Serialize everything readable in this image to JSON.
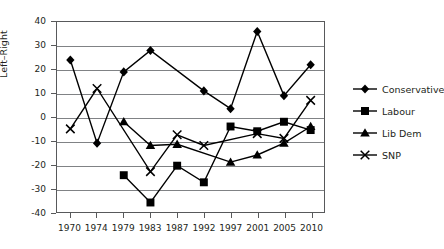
{
  "chart_data": {
    "type": "line",
    "title": "",
    "xlabel": "",
    "ylabel": "Left–Right",
    "categories": [
      "1970",
      "1974",
      "1979",
      "1983",
      "1987",
      "1992",
      "1997",
      "2001",
      "2005",
      "2010"
    ],
    "ylim": [
      -40,
      40
    ],
    "yticks": [
      40,
      30,
      20,
      10,
      0,
      -10,
      -20,
      -30,
      -40
    ],
    "ytick_labels": [
      "40",
      "30",
      "20",
      "10",
      "0",
      "-10",
      "-20",
      "-30",
      "-40"
    ],
    "grid": true,
    "legend_position": "right",
    "series": [
      {
        "name": "Conservative",
        "marker": "diamond",
        "color": "#000000",
        "values": [
          24,
          -11,
          19,
          28,
          null,
          11,
          3.5,
          36,
          9,
          22
        ]
      },
      {
        "name": "Labour",
        "marker": "square",
        "color": "#000000",
        "values": [
          null,
          null,
          -24.5,
          -36,
          -20.5,
          -27.5,
          -4,
          -6,
          -2,
          -5.5
        ]
      },
      {
        "name": "Lib Dem",
        "marker": "triangle",
        "color": "#000000",
        "values": [
          null,
          null,
          -2,
          -12,
          -11.5,
          null,
          -19,
          -16,
          -11,
          -4
        ]
      },
      {
        "name": "SNP",
        "marker": "cross",
        "color": "#000000",
        "values": [
          -5,
          12,
          null,
          -23,
          -7.5,
          -12,
          null,
          -7,
          -9,
          7
        ]
      }
    ]
  },
  "axis": {
    "y_title": "Left–Right"
  },
  "legend": {
    "items": [
      {
        "label": "Conservative",
        "marker": "diamond"
      },
      {
        "label": "Labour",
        "marker": "square"
      },
      {
        "label": "Lib Dem",
        "marker": "triangle"
      },
      {
        "label": "SNP",
        "marker": "cross"
      }
    ]
  }
}
